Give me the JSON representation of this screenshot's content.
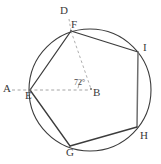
{
  "figure": {
    "type": "circle-inscribed-polygon",
    "circle": {
      "center_label": "B",
      "cx": 90,
      "cy": 90,
      "r": 61,
      "stroke": "#3c3c3c"
    },
    "points": [
      {
        "id": "A",
        "label": "A",
        "x": 6,
        "y": 89,
        "on_circle": false,
        "label_dx": 0,
        "label_dy": 0
      },
      {
        "id": "B",
        "label": "B",
        "x": 92,
        "y": 90,
        "on_circle": false,
        "label_dx": 4,
        "label_dy": 9
      },
      {
        "id": "D",
        "label": "D",
        "x": 66,
        "y": 11,
        "on_circle": false,
        "label_dx": 0,
        "label_dy": 0
      },
      {
        "id": "E",
        "label": "E",
        "x": 30,
        "y": 90,
        "on_circle": true,
        "label_dx": -2,
        "label_dy": 11
      },
      {
        "id": "F",
        "label": "F",
        "x": 71,
        "y": 31,
        "on_circle": true,
        "label_dx": 2,
        "label_dy": -3
      },
      {
        "id": "G",
        "label": "G",
        "x": 70,
        "y": 146,
        "on_circle": true,
        "label_dx": -2,
        "label_dy": 13
      },
      {
        "id": "H",
        "label": "H",
        "x": 137,
        "y": 127,
        "on_circle": true,
        "label_dx": 5,
        "label_dy": 11
      },
      {
        "id": "I",
        "label": "I",
        "x": 138,
        "y": 52,
        "on_circle": true,
        "label_dx": 6,
        "label_dy": -2
      }
    ],
    "polygon_vertices": [
      "E",
      "F",
      "I",
      "H",
      "G"
    ],
    "solid_segments": [
      {
        "from": "E",
        "to": "F"
      },
      {
        "from": "F",
        "to": "I"
      },
      {
        "from": "I",
        "to": "H"
      },
      {
        "from": "H",
        "to": "G"
      },
      {
        "from": "G",
        "to": "E"
      }
    ],
    "dashed_segments": [
      {
        "from": "A",
        "to": "B",
        "note": "horizontal ray through E to center B"
      },
      {
        "from": "D",
        "to": "F",
        "note": "ray above F"
      },
      {
        "from": "F",
        "to": "B",
        "note": "radius from F to center B"
      }
    ],
    "angle": {
      "label": "72°",
      "vertex": "B",
      "rays": [
        "F",
        "A"
      ],
      "label_x": 74,
      "label_y": 81
    },
    "stroke_colors": {
      "circle": "#3c3c3c",
      "chord": "#3c3c3c",
      "dashed": "#8a8a8a",
      "label_text": "#3a3a3a"
    }
  }
}
